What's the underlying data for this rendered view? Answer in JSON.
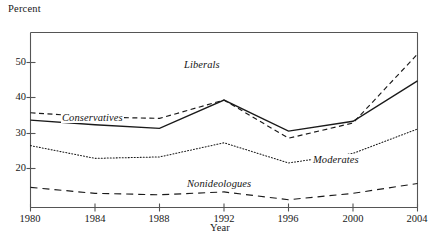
{
  "figure": {
    "y_axis_title": "Percent",
    "x_axis_title": "Year"
  },
  "axis": {
    "y_ticks": [
      "50",
      "40",
      "30",
      "20"
    ],
    "x_ticks": [
      "1980",
      "1984",
      "1988",
      "1992",
      "1996",
      "2000",
      "2004"
    ]
  },
  "series_labels": {
    "liberals": "Liberals",
    "conservatives": "Conservatives",
    "moderates": "Moderates",
    "nonideologues": "Nonideologues"
  },
  "colors": {
    "ink": "#1a1a1a",
    "axis": "#555555",
    "background": "#ffffff"
  },
  "chart_data": {
    "type": "line",
    "title": "",
    "xlabel": "Year",
    "ylabel": "Percent",
    "x": [
      1980,
      1984,
      1988,
      1992,
      1996,
      2000,
      2004
    ],
    "xlim": [
      1980,
      2004
    ],
    "ylim": [
      12.6,
      62.1
    ],
    "yticks": [
      20,
      30,
      40,
      50
    ],
    "xticks": [
      1980,
      1984,
      1988,
      1992,
      1996,
      2000,
      2004
    ],
    "grid": false,
    "legend": "inline-labels",
    "series": [
      {
        "name": "Liberals",
        "style": "dashed",
        "values": [
          39.4,
          38.2,
          37.8,
          43.0,
          32.2,
          36.5,
          56.0
        ]
      },
      {
        "name": "Conservatives",
        "style": "solid",
        "values": [
          37.3,
          36.0,
          35.0,
          43.0,
          34.2,
          37.0,
          48.4
        ]
      },
      {
        "name": "Moderates",
        "style": "dotted",
        "values": [
          30.1,
          26.5,
          26.9,
          30.9,
          25.2,
          27.9,
          34.8
        ]
      },
      {
        "name": "Nonideologues",
        "style": "long-dashed",
        "values": [
          18.3,
          16.6,
          16.2,
          17.0,
          14.8,
          16.6,
          19.4
        ]
      }
    ]
  }
}
